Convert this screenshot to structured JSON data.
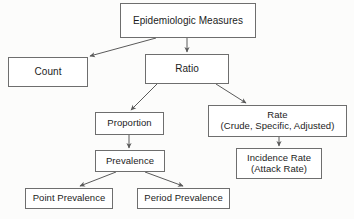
{
  "diagram": {
    "title": "Epidemiologic Measures",
    "type": "flowchart",
    "background_color": "#fcfcfb",
    "box_border_color": "#6e6e6e",
    "box_fill_color": "#ffffff",
    "text_color": "#1c1c1c",
    "edge_color": "#5a5a5a",
    "nodes": [
      {
        "id": "epidemiologic-measures",
        "lines": [
          "Epidemiologic Measures"
        ],
        "x": 120,
        "y": 3,
        "w": 136,
        "h": 35,
        "font_size": 10
      },
      {
        "id": "count",
        "lines": [
          "Count"
        ],
        "x": 8,
        "y": 57,
        "w": 80,
        "h": 30,
        "font_size": 10
      },
      {
        "id": "ratio",
        "lines": [
          "Ratio"
        ],
        "x": 145,
        "y": 54,
        "w": 84,
        "h": 30,
        "font_size": 10
      },
      {
        "id": "proportion",
        "lines": [
          "Proportion"
        ],
        "x": 95,
        "y": 112,
        "w": 69,
        "h": 23,
        "font_size": 9.5
      },
      {
        "id": "rate",
        "lines": [
          "Rate",
          "(Crude, Specific, Adjusted)"
        ],
        "x": 208,
        "y": 105,
        "w": 139,
        "h": 32,
        "font_size": 9.5
      },
      {
        "id": "prevalence",
        "lines": [
          "Prevalence"
        ],
        "x": 95,
        "y": 150,
        "w": 70,
        "h": 22,
        "font_size": 9.5
      },
      {
        "id": "incidence-rate",
        "lines": [
          "Incidence Rate",
          "(Attack Rate)"
        ],
        "x": 236,
        "y": 148,
        "w": 86,
        "h": 31,
        "font_size": 9.5
      },
      {
        "id": "point-prevalence",
        "lines": [
          "Point Prevalence"
        ],
        "x": 25,
        "y": 188,
        "w": 88,
        "h": 21,
        "font_size": 9.5
      },
      {
        "id": "period-prevalence",
        "lines": [
          "Period Prevalence"
        ],
        "x": 137,
        "y": 188,
        "w": 93,
        "h": 21,
        "font_size": 9.5
      }
    ],
    "edges": [
      {
        "id": "measures-to-count",
        "from": "epidemiologic-measures",
        "to": "count",
        "x1": 156,
        "y1": 38,
        "x2": 90,
        "y2": 56
      },
      {
        "id": "measures-to-ratio",
        "from": "epidemiologic-measures",
        "to": "ratio",
        "x1": 187,
        "y1": 38,
        "x2": 187,
        "y2": 52
      },
      {
        "id": "ratio-to-proportion",
        "from": "ratio",
        "to": "proportion",
        "x1": 157,
        "y1": 84,
        "x2": 131,
        "y2": 110
      },
      {
        "id": "ratio-to-rate",
        "from": "ratio",
        "to": "rate",
        "x1": 216,
        "y1": 84,
        "x2": 246,
        "y2": 103
      },
      {
        "id": "proportion-to-prevalence",
        "from": "proportion",
        "to": "prevalence",
        "x1": 129,
        "y1": 135,
        "x2": 129,
        "y2": 148
      },
      {
        "id": "rate-to-incidence-rate",
        "from": "rate",
        "to": "incidence-rate",
        "x1": 279,
        "y1": 137,
        "x2": 279,
        "y2": 146
      },
      {
        "id": "prevalence-to-point-prevalence",
        "from": "prevalence",
        "to": "point-prevalence",
        "x1": 116,
        "y1": 172,
        "x2": 80,
        "y2": 186
      },
      {
        "id": "prevalence-to-period-prevalence",
        "from": "prevalence",
        "to": "period-prevalence",
        "x1": 145,
        "y1": 172,
        "x2": 183,
        "y2": 186
      }
    ]
  }
}
